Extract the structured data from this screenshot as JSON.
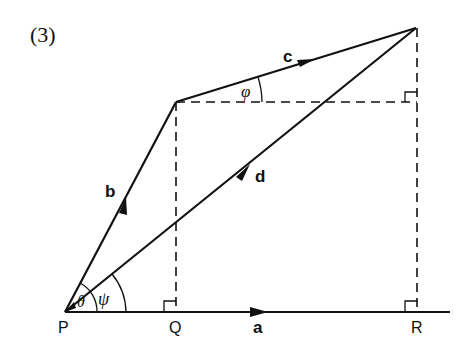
{
  "figure": {
    "number_label": "(3)",
    "points": {
      "P": {
        "label": "P",
        "x": 65,
        "y": 312
      },
      "Q": {
        "label": "Q",
        "x": 176,
        "y": 312
      },
      "R": {
        "label": "R",
        "x": 417,
        "y": 312
      },
      "B_top": {
        "x": 176,
        "y": 102
      },
      "C_top": {
        "x": 416,
        "y": 28
      }
    },
    "vectors": {
      "a": {
        "label": "a"
      },
      "b": {
        "label": "b"
      },
      "c": {
        "label": "c"
      },
      "d": {
        "label": "d"
      }
    },
    "angles": {
      "theta": "θ",
      "psi": "ψ",
      "phi": "φ"
    },
    "colors": {
      "line": "#111111",
      "background": "#ffffff"
    }
  }
}
